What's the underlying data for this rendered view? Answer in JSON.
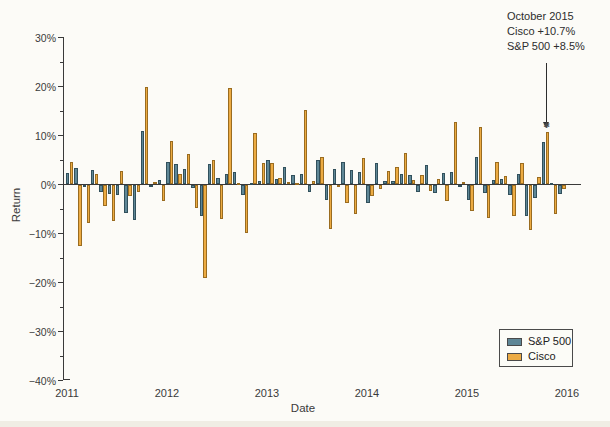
{
  "page": {
    "ylabel": "Return",
    "xlabel": "Date",
    "annotation": {
      "lines": [
        "October 2015",
        "Cisco +10.7%",
        "S&P 500 +8.5%"
      ]
    }
  },
  "chart_data": {
    "type": "bar",
    "title": "",
    "xlabel": "Date",
    "ylabel": "Return",
    "ylim": [
      -40,
      30
    ],
    "y_unit": "%",
    "y_major_ticks": [
      30,
      20,
      10,
      0,
      -10,
      -20,
      -30,
      -40
    ],
    "y_minor_ticks": [
      25,
      15,
      5,
      -5,
      -15,
      -25,
      -35
    ],
    "x_tick_labels": [
      "2011",
      "2012",
      "2013",
      "2014",
      "2015",
      "2016"
    ],
    "legend_position": "lower right",
    "grid": false,
    "x": [
      "2011-01",
      "2011-02",
      "2011-03",
      "2011-04",
      "2011-05",
      "2011-06",
      "2011-07",
      "2011-08",
      "2011-09",
      "2011-10",
      "2011-11",
      "2011-12",
      "2012-01",
      "2012-02",
      "2012-03",
      "2012-04",
      "2012-05",
      "2012-06",
      "2012-07",
      "2012-08",
      "2012-09",
      "2012-10",
      "2012-11",
      "2012-12",
      "2013-01",
      "2013-02",
      "2013-03",
      "2013-04",
      "2013-05",
      "2013-06",
      "2013-07",
      "2013-08",
      "2013-09",
      "2013-10",
      "2013-11",
      "2013-12",
      "2014-01",
      "2014-02",
      "2014-03",
      "2014-04",
      "2014-05",
      "2014-06",
      "2014-07",
      "2014-08",
      "2014-09",
      "2014-10",
      "2014-11",
      "2014-12",
      "2015-01",
      "2015-02",
      "2015-03",
      "2015-04",
      "2015-05",
      "2015-06",
      "2015-07",
      "2015-08",
      "2015-09",
      "2015-10",
      "2015-11",
      "2015-12"
    ],
    "series": [
      {
        "name": "S&P 500",
        "color": "#5f8796",
        "border_color": "#31505c",
        "values": [
          2.3,
          3.2,
          -0.1,
          2.8,
          -1.4,
          -1.8,
          -2.1,
          -5.7,
          -7.2,
          10.8,
          -0.5,
          0.9,
          4.4,
          4.1,
          3.1,
          -0.7,
          -6.3,
          4.0,
          1.3,
          2.0,
          2.4,
          -2.0,
          0.3,
          0.7,
          5.0,
          1.1,
          3.4,
          1.8,
          2.1,
          -1.5,
          4.9,
          -3.1,
          3.0,
          4.5,
          2.8,
          2.4,
          -3.6,
          4.3,
          0.7,
          0.6,
          2.1,
          1.9,
          -1.5,
          3.8,
          -1.6,
          2.3,
          2.5,
          -0.4,
          -3.1,
          5.5,
          -1.7,
          0.9,
          1.1,
          -2.1,
          2.0,
          -6.3,
          -2.6,
          8.5,
          0.1,
          -1.8
        ]
      },
      {
        "name": "Cisco",
        "color": "#ecab43",
        "border_color": "#9a6c20",
        "values": [
          4.4,
          -12.4,
          -7.8,
          2.0,
          -4.2,
          -7.4,
          2.6,
          -2.3,
          -1.5,
          19.8,
          0.5,
          -3.3,
          8.7,
          2.0,
          6.1,
          -4.6,
          -19.0,
          5.0,
          -7.0,
          19.6,
          0.2,
          -9.8,
          10.5,
          4.3,
          4.2,
          1.2,
          0.4,
          0.1,
          15.1,
          0.6,
          5.5,
          -9.0,
          -0.5,
          -3.6,
          -5.9,
          5.3,
          -2.3,
          -0.8,
          2.7,
          3.4,
          6.4,
          0.8,
          1.8,
          -1.2,
          1.0,
          -3.3,
          12.7,
          0.5,
          -5.3,
          11.7,
          -6.7,
          4.5,
          1.6,
          -6.3,
          4.2,
          -9.1,
          1.4,
          10.7,
          -5.9,
          -0.9
        ]
      }
    ],
    "annotation": {
      "target_x": "2015-10",
      "lines": [
        "October 2015",
        "Cisco +10.7%",
        "S&P 500 +8.5%"
      ]
    }
  }
}
